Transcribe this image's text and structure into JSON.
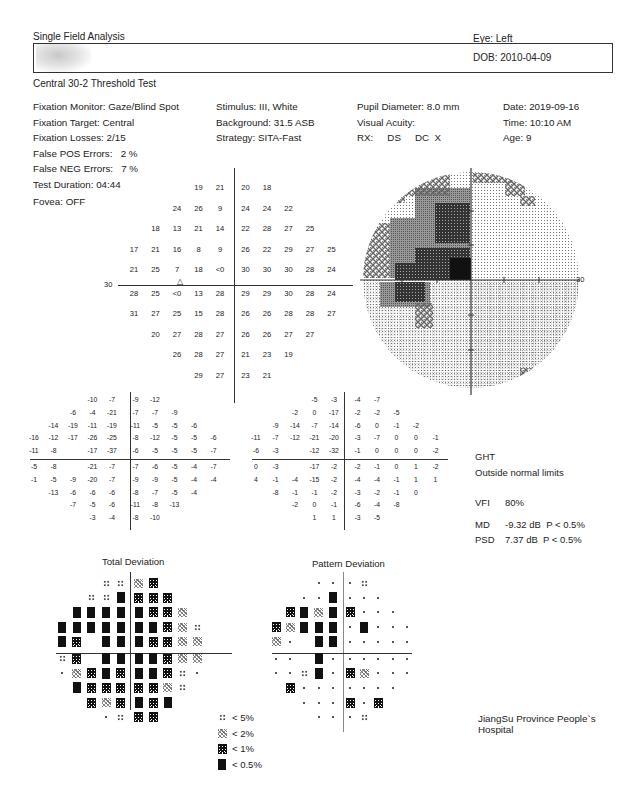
{
  "header": {
    "title": "Single Field Analysis",
    "eye": "Eye: Left",
    "dob": "DOB: 2010-04-09",
    "test_name": "Central 30-2 Threshold Test"
  },
  "info": {
    "col1": [
      "Fixation Monitor: Gaze/Blind Spot",
      "Fixation Target: Central",
      "Fixation Losses: 2/15",
      "False POS Errors:   2 %",
      "False NEG Errors:   7 %",
      "Test Duration: 04:44"
    ],
    "col2": [
      "Stimulus: III, White",
      "Background: 31.5 ASB",
      "Strategy: SITA-Fast"
    ],
    "col3": [
      "Pupil Diameter: 8.0 mm",
      "Visual Acuity:"
    ],
    "rx": [
      "RX:",
      "DS",
      "DC  X"
    ],
    "col4": [
      "Date: 2019-09-16",
      "Time: 10:10 AM",
      "Age: 9"
    ],
    "fovea": "Fovea: OFF"
  },
  "threshold": {
    "axis_label_left": "30",
    "axis_label_right": "30",
    "rows": [
      {
        "start": 3,
        "values": [
          "19",
          "21",
          "20",
          "18"
        ]
      },
      {
        "start": 2,
        "values": [
          "24",
          "26",
          "9",
          "24",
          "24",
          "22"
        ]
      },
      {
        "start": 1,
        "values": [
          "18",
          "13",
          "21",
          "14",
          "22",
          "28",
          "27",
          "25"
        ]
      },
      {
        "start": 0,
        "values": [
          "17",
          "21",
          "16",
          "8",
          "9",
          "26",
          "22",
          "29",
          "27",
          "25"
        ]
      },
      {
        "start": 0,
        "values": [
          "21",
          "25",
          "7",
          "18",
          "<0",
          "30",
          "30",
          "30",
          "28",
          "24"
        ]
      },
      {
        "start": 0,
        "values": [
          "28",
          "25",
          "<0",
          "13",
          "28",
          "29",
          "29",
          "30",
          "28",
          "24"
        ]
      },
      {
        "start": 0,
        "values": [
          "31",
          "27",
          "25",
          "15",
          "28",
          "26",
          "26",
          "28",
          "28",
          "27"
        ]
      },
      {
        "start": 1,
        "values": [
          "20",
          "27",
          "28",
          "27",
          "26",
          "26",
          "27",
          "27"
        ]
      },
      {
        "start": 2,
        "values": [
          "26",
          "28",
          "27",
          "21",
          "23",
          "19"
        ]
      },
      {
        "start": 3,
        "values": [
          "29",
          "27",
          "23",
          "21"
        ]
      }
    ]
  },
  "total_deviation": {
    "title": "Total Deviation",
    "rows": [
      {
        "start": 3,
        "values": [
          "-10",
          "-7",
          "-9",
          "-12"
        ]
      },
      {
        "start": 2,
        "values": [
          "-6",
          "-4",
          "-21",
          "-7",
          "-7",
          "-9"
        ]
      },
      {
        "start": 1,
        "values": [
          "-14",
          "-19",
          "-11",
          "-19",
          "-11",
          "-5",
          "-5",
          "-6"
        ]
      },
      {
        "start": 0,
        "values": [
          "-16",
          "-12",
          "-17",
          "-26",
          "-25",
          "-8",
          "-12",
          "-5",
          "-5",
          "-6"
        ]
      },
      {
        "start": 0,
        "values": [
          "-11",
          "-8",
          "",
          "-17",
          "-37",
          "-6",
          "-5",
          "-5",
          "-5",
          "-7"
        ]
      },
      {
        "start": 0,
        "values": [
          "-5",
          "-8",
          "",
          "-21",
          "-7",
          "-7",
          "-6",
          "-5",
          "-4",
          "-7"
        ]
      },
      {
        "start": 0,
        "values": [
          "-1",
          "-5",
          "-9",
          "-20",
          "-7",
          "-9",
          "-9",
          "-5",
          "-4",
          "-4"
        ]
      },
      {
        "start": 1,
        "values": [
          "-13",
          "-6",
          "-6",
          "-6",
          "-8",
          "-7",
          "-5",
          "-4"
        ]
      },
      {
        "start": 2,
        "values": [
          "-7",
          "-5",
          "-6",
          "-11",
          "-8",
          "-13"
        ]
      },
      {
        "start": 3,
        "values": [
          "-3",
          "-4",
          "-8",
          "-10"
        ]
      }
    ],
    "symbols": [
      {
        "start": 3,
        "values": [
          "5",
          "5",
          "2",
          "1"
        ]
      },
      {
        "start": 2,
        "values": [
          "5",
          "5",
          "05",
          "1",
          "1",
          "1"
        ]
      },
      {
        "start": 1,
        "values": [
          "05",
          "05",
          "05",
          "05",
          "05",
          "1",
          "1",
          "2"
        ]
      },
      {
        "start": 0,
        "values": [
          "05",
          "05",
          "05",
          "05",
          "05",
          "05",
          "05",
          "1",
          "2",
          "5"
        ]
      },
      {
        "start": 0,
        "values": [
          "05",
          "1",
          "",
          "05",
          "05",
          "05",
          "1",
          "1",
          "2",
          "2"
        ]
      },
      {
        "start": 0,
        "values": [
          "5",
          "1",
          "",
          "05",
          "05",
          "05",
          "05",
          "1",
          "2",
          "2"
        ]
      },
      {
        "start": 0,
        "values": [
          "dot",
          "2",
          "1",
          "05",
          "1",
          "05",
          "05",
          "1",
          "5",
          "dot"
        ]
      },
      {
        "start": 1,
        "values": [
          "05",
          "1",
          "1",
          "1",
          "1",
          "1",
          "2",
          "5"
        ]
      },
      {
        "start": 2,
        "values": [
          "1",
          "2",
          "1",
          "05",
          "1",
          "05"
        ]
      },
      {
        "start": 3,
        "values": [
          "dot",
          "5",
          "1",
          "1"
        ]
      }
    ]
  },
  "pattern_deviation": {
    "title": "Pattern Deviation",
    "rows": [
      {
        "start": 3,
        "values": [
          "-5",
          "-3",
          "-4",
          "-7"
        ]
      },
      {
        "start": 2,
        "values": [
          "-2",
          "0",
          "-17",
          "-2",
          "-2",
          "-5"
        ]
      },
      {
        "start": 1,
        "values": [
          "-9",
          "-14",
          "-7",
          "-14",
          "-6",
          "0",
          "-1",
          "-2"
        ]
      },
      {
        "start": 0,
        "values": [
          "-11",
          "-7",
          "-12",
          "-21",
          "-20",
          "-3",
          "-7",
          "0",
          "0",
          "-1"
        ]
      },
      {
        "start": 0,
        "values": [
          "-6",
          "-3",
          "",
          "-12",
          "-32",
          "-1",
          "0",
          "0",
          "0",
          "-2"
        ]
      },
      {
        "start": 0,
        "values": [
          "0",
          "-3",
          "",
          "-17",
          "-2",
          "-2",
          "-1",
          "0",
          "1",
          "-2"
        ]
      },
      {
        "start": 0,
        "values": [
          "4",
          "-1",
          "-4",
          "-15",
          "-2",
          "-4",
          "-4",
          "-1",
          "1",
          "1"
        ]
      },
      {
        "start": 1,
        "values": [
          "-8",
          "-1",
          "-1",
          "-2",
          "-3",
          "-2",
          "-1",
          "0"
        ]
      },
      {
        "start": 2,
        "values": [
          "-2",
          "0",
          "-1",
          "-6",
          "-4",
          "-8"
        ]
      },
      {
        "start": 3,
        "values": [
          "1",
          "1",
          "-3",
          "-5"
        ]
      }
    ],
    "symbols": [
      {
        "start": 3,
        "values": [
          "dot",
          "dot",
          "dot",
          "5"
        ]
      },
      {
        "start": 2,
        "values": [
          "dot",
          "dot",
          "05",
          "dot",
          "dot",
          "dot"
        ]
      },
      {
        "start": 1,
        "values": [
          "1",
          "05",
          "2",
          "05",
          "1",
          "dot",
          "dot",
          "dot"
        ]
      },
      {
        "start": 0,
        "values": [
          "1",
          "2",
          "05",
          "05",
          "05",
          "dot",
          "05",
          "dot",
          "dot",
          "dot"
        ]
      },
      {
        "start": 0,
        "values": [
          "2",
          "dot",
          "",
          "05",
          "05",
          "dot",
          "dot",
          "dot",
          "dot",
          "dot"
        ]
      },
      {
        "start": 0,
        "values": [
          "dot",
          "dot",
          "",
          "05",
          "dot",
          "dot",
          "dot",
          "dot",
          "dot",
          "dot"
        ]
      },
      {
        "start": 0,
        "values": [
          "dot",
          "dot",
          "5",
          "05",
          "dot",
          "1",
          "2",
          "dot",
          "dot",
          "dot"
        ]
      },
      {
        "start": 1,
        "values": [
          "1",
          "dot",
          "dot",
          "dot",
          "dot",
          "dot",
          "dot",
          "dot"
        ]
      },
      {
        "start": 2,
        "values": [
          "dot",
          "dot",
          "dot",
          "1",
          "dot",
          "1"
        ]
      },
      {
        "start": 3,
        "values": [
          "dot",
          "dot",
          "dot",
          "5"
        ]
      }
    ]
  },
  "indices": {
    "ght_label": "GHT",
    "ght_value": "Outside normal limits",
    "vfi_label": "VFI",
    "vfi_value": "80%",
    "md_label": "MD",
    "md_value": "-9.32 dB  P < 0.5%",
    "psd_label": "PSD",
    "psd_value": "7.37 dB  P < 0.5%"
  },
  "legend": [
    {
      "symbol": "5",
      "label": "< 5%"
    },
    {
      "symbol": "2",
      "label": "< 2%"
    },
    {
      "symbol": "1",
      "label": "< 1%"
    },
    {
      "symbol": "05",
      "label": "< 0.5%"
    }
  ],
  "footer": {
    "hospital": "JiangSu Province People`s Hospital"
  },
  "colors": {
    "ink": "#222222",
    "dark_defect": "#111111"
  }
}
